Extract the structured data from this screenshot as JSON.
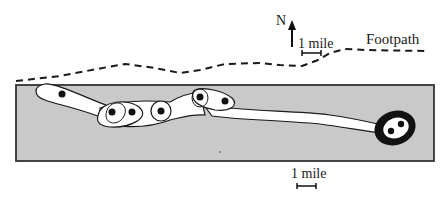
{
  "diagram": {
    "type": "map",
    "compass": {
      "label": "N"
    },
    "top_scale": {
      "label": "1 mile"
    },
    "bottom_scale": {
      "label": "1 mile"
    },
    "footpath": {
      "label": "Footpath",
      "style": "dashed"
    },
    "colors": {
      "land": "#c9c9c9",
      "outline": "#1a1a1a",
      "path_fill": "#ffffff",
      "dot": "#111111"
    },
    "features": [
      {
        "name": "west-elongated-blob",
        "dots": 1
      },
      {
        "name": "two-dot-loop",
        "dots": 2
      },
      {
        "name": "single-dot-loop",
        "dots": 1
      },
      {
        "name": "east-two-dot-blob",
        "dots": 2
      },
      {
        "name": "long-stem-trail",
        "dots": 0
      },
      {
        "name": "thick-ring-terminal",
        "dots": 2
      }
    ]
  }
}
